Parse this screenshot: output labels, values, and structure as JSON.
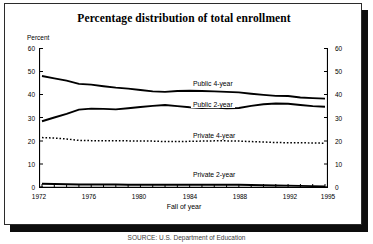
{
  "figure": {
    "title": "Percentage distribution of total enrollment",
    "source_note": "SOURCE: U.S. Department of Education"
  },
  "axes": {
    "y_unit_label": "Percent",
    "x_title": "Fall of year",
    "y_ticks": [
      "0",
      "10",
      "20",
      "30",
      "40",
      "50",
      "60"
    ],
    "y_ticks_right": [
      "0",
      "10",
      "20",
      "30",
      "40",
      "50",
      "60"
    ],
    "x_ticks": [
      "1972",
      "1976",
      "1980",
      "1984",
      "1988",
      "1992",
      "1995"
    ]
  },
  "series_labels": {
    "public4": "Public 4-year",
    "public2": "Public 2-year",
    "private4": "Private 4-year",
    "private2": "Private 2-year"
  },
  "chart_data": {
    "type": "line",
    "title": "Percentage distribution of total enrollment",
    "xlabel": "Fall of year",
    "ylabel": "Percent",
    "xlim": [
      1972,
      1995
    ],
    "ylim": [
      0,
      60
    ],
    "grid": false,
    "legend": "inline-labels",
    "x": [
      1972,
      1973,
      1974,
      1975,
      1976,
      1977,
      1978,
      1979,
      1980,
      1981,
      1982,
      1983,
      1984,
      1985,
      1986,
      1987,
      1988,
      1989,
      1990,
      1991,
      1992,
      1993,
      1994,
      1995
    ],
    "series": [
      {
        "name": "Public 4-year",
        "style": "solid",
        "color": "#000000",
        "values": [
          48.0,
          47.0,
          46.0,
          44.6,
          44.3,
          43.6,
          43.0,
          42.6,
          42.0,
          41.4,
          41.2,
          41.6,
          41.7,
          41.6,
          41.4,
          41.2,
          41.0,
          40.4,
          39.9,
          39.5,
          39.4,
          38.8,
          38.5,
          38.3
        ]
      },
      {
        "name": "Public 2-year",
        "style": "solid",
        "color": "#000000",
        "values": [
          28.6,
          30.2,
          31.8,
          33.6,
          34.0,
          33.9,
          33.7,
          34.2,
          34.7,
          35.2,
          35.6,
          35.1,
          34.6,
          34.3,
          34.5,
          34.2,
          34.3,
          35.2,
          35.9,
          36.2,
          36.1,
          35.6,
          35.1,
          34.8
        ]
      },
      {
        "name": "Private 4-year",
        "style": "dotted",
        "color": "#000000",
        "values": [
          21.6,
          21.4,
          21.0,
          20.4,
          20.3,
          20.3,
          20.3,
          20.2,
          20.1,
          20.1,
          19.9,
          19.9,
          20.0,
          20.1,
          20.2,
          20.2,
          20.1,
          19.9,
          19.7,
          19.5,
          19.4,
          19.4,
          19.3,
          19.2
        ]
      },
      {
        "name": "Private 2-year",
        "style": "solid",
        "color": "#000000",
        "values": [
          1.8,
          1.7,
          1.6,
          1.5,
          1.5,
          1.5,
          1.5,
          1.4,
          1.4,
          1.4,
          1.4,
          1.4,
          1.4,
          1.4,
          1.4,
          1.4,
          1.4,
          1.3,
          1.2,
          1.1,
          1.0,
          0.9,
          0.8,
          0.7
        ]
      }
    ]
  }
}
